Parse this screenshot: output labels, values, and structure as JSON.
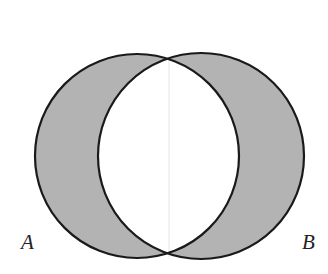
{
  "diagram": {
    "type": "venn",
    "sets": [
      {
        "name": "A",
        "label": "A",
        "cx": 137,
        "cy": 156,
        "r": 102
      },
      {
        "name": "B",
        "label": "B",
        "cx": 201,
        "cy": 156,
        "r": 103
      }
    ],
    "shaded": "A symmetric difference B",
    "colors": {
      "fill": "#b3b3b3",
      "stroke": "#1a1a1a",
      "intersection": "#ffffff"
    }
  }
}
